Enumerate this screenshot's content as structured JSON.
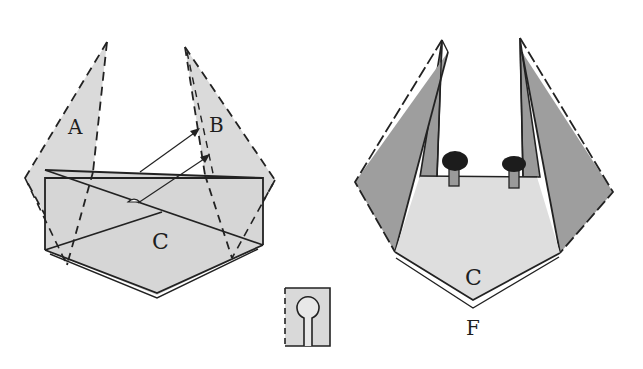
{
  "diagram": {
    "type": "origami-instruction",
    "colors": {
      "paper_light": "#d9d9d9",
      "paper_dark": "#9a9a9a",
      "line": "#222222",
      "background": "#ffffff",
      "knob": "#1c1c1c"
    },
    "left_step": {
      "labels": {
        "flap_a": "A",
        "flap_b": "B",
        "body_c": "C"
      },
      "arrows": 2
    },
    "right_step": {
      "labels": {
        "body_c": "C",
        "caption": "F"
      },
      "knobs": 2
    },
    "symbol": {
      "name": "keyhole-fold-symbol"
    }
  }
}
